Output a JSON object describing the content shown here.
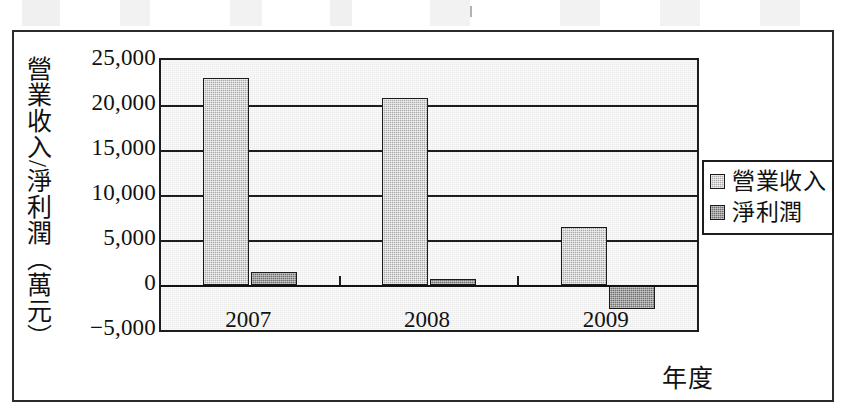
{
  "chart_data": {
    "type": "bar",
    "title": "",
    "categories": [
      "2007",
      "2008",
      "2009"
    ],
    "series": [
      {
        "name": "營業收入",
        "values": [
          23000,
          20800,
          6400
        ],
        "color": "#a8a8a8"
      },
      {
        "name": "淨利潤",
        "values": [
          1500,
          700,
          -2700
        ],
        "color": "#6f6f6f"
      }
    ],
    "xlabel": "年度",
    "ylabel": "營業收入/淨利潤（萬元）",
    "ylim": [
      -5000,
      25000
    ],
    "ytick_values": [
      25000,
      20000,
      15000,
      10000,
      5000,
      0,
      -5000
    ],
    "ytick_labels": [
      "25,000",
      "20,000",
      "15,000",
      "10,000",
      "5,000",
      "0",
      "−5,000"
    ],
    "grid": true,
    "legend_position": "right"
  },
  "axis": {
    "y_title": "營業收入/淨利潤（萬元）",
    "x_title": "年度",
    "y_ticks": [
      "25,000",
      "20,000",
      "15,000",
      "10,000",
      "5,000",
      "0",
      "−5,000"
    ],
    "x_ticks": [
      "2007",
      "2008",
      "2009"
    ]
  },
  "legend": {
    "items": [
      {
        "label": "營業收入",
        "swatch": "light-gray-swatch"
      },
      {
        "label": "淨利潤",
        "swatch": "dark-gray-swatch"
      }
    ]
  }
}
